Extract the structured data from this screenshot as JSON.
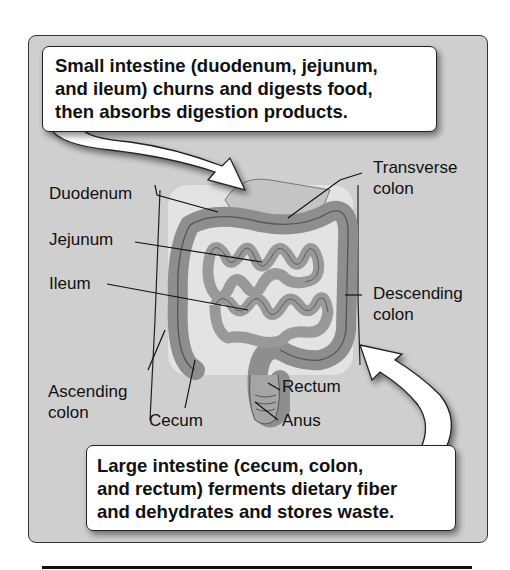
{
  "top_callout": {
    "lines": [
      "Small intestine (duodenum, jejunum,",
      "and ileum) churns and digests food,",
      "then absorbs digestion products."
    ]
  },
  "bottom_callout": {
    "lines": [
      "Large intestine (cecum, colon,",
      "and rectum) ferments dietary fiber",
      "and dehydrates and stores waste."
    ]
  },
  "labels": {
    "duodenum": "Duodenum",
    "jejunum": "Jejunum",
    "ileum": "Ileum",
    "transverse_1": "Transverse",
    "transverse_2": "colon",
    "descending_1": "Descending",
    "descending_2": "colon",
    "ascending_1": "Ascending",
    "ascending_2": "colon",
    "cecum": "Cecum",
    "rectum": "Rectum",
    "anus": "Anus"
  },
  "colors": {
    "panel": "#cfcfcf",
    "organ": "#9a9a9a",
    "body": "#e6e6e6",
    "line": "#111111"
  }
}
